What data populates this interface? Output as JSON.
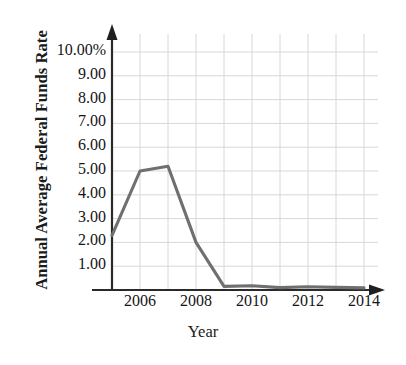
{
  "chart_data": {
    "type": "line",
    "title": "",
    "xlabel": "Year",
    "ylabel": "Annual Average Federal Funds Rate",
    "x": [
      2005,
      2006,
      2007,
      2008,
      2009,
      2010,
      2011,
      2012,
      2013,
      2014
    ],
    "values": [
      2.3,
      5.0,
      5.2,
      2.0,
      0.15,
      0.18,
      0.1,
      0.14,
      0.11,
      0.09
    ],
    "series": [
      {
        "name": "Annual Average Federal Funds Rate",
        "values": [
          2.3,
          5.0,
          5.2,
          2.0,
          0.15,
          0.18,
          0.1,
          0.14,
          0.11,
          0.09
        ]
      }
    ],
    "xlim": [
      2005,
      2015
    ],
    "ylim": [
      0,
      10
    ],
    "ytick_labels": [
      "10.00%",
      "9.00",
      "8.00",
      "7.00",
      "6.00",
      "5.00",
      "4.00",
      "3.00",
      "2.00",
      "1.00"
    ],
    "ytick_values": [
      10,
      9,
      8,
      7,
      6,
      5,
      4,
      3,
      2,
      1
    ],
    "xtick_labels": [
      "2006",
      "2008",
      "2010",
      "2012",
      "2014"
    ],
    "xtick_values": [
      2006,
      2008,
      2010,
      2012,
      2014
    ],
    "grid": true,
    "legend": false,
    "legend_position": "none",
    "colors": {
      "line": "#6f6f6f",
      "grid": "#d8d8dc",
      "axis": "#2a2a2a",
      "text": "#151515",
      "background": "#ffffff"
    }
  },
  "axes": {
    "y_title": "Annual Average Federal Funds Rate",
    "x_title": "Year",
    "y_ticks": [
      {
        "label": "10.00%",
        "value": 10
      },
      {
        "label": "9.00",
        "value": 9
      },
      {
        "label": "8.00",
        "value": 8
      },
      {
        "label": "7.00",
        "value": 7
      },
      {
        "label": "6.00",
        "value": 6
      },
      {
        "label": "5.00",
        "value": 5
      },
      {
        "label": "4.00",
        "value": 4
      },
      {
        "label": "3.00",
        "value": 3
      },
      {
        "label": "2.00",
        "value": 2
      },
      {
        "label": "1.00",
        "value": 1
      }
    ],
    "x_ticks": [
      {
        "label": "2006",
        "value": 2006
      },
      {
        "label": "2008",
        "value": 2008
      },
      {
        "label": "2010",
        "value": 2010
      },
      {
        "label": "2012",
        "value": 2012
      },
      {
        "label": "2014",
        "value": 2014
      }
    ]
  }
}
